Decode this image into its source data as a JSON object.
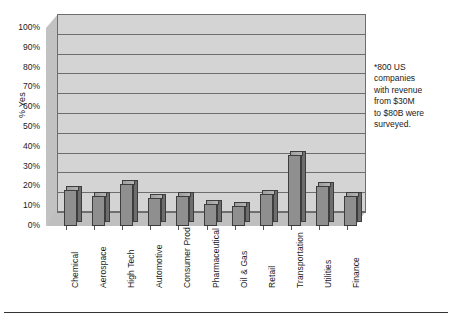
{
  "chart_data": {
    "type": "bar",
    "title": "",
    "subtitle": "",
    "xlabel": "",
    "ylabel": "% Yes",
    "ylim": [
      0,
      100
    ],
    "yunit": "%",
    "grid": true,
    "legend": false,
    "style": "3d-column",
    "categories": [
      "Chemical",
      "Aerospace",
      "High Tech",
      "Automotive",
      "Consumer Prod",
      "Pharmaceutical",
      "Oil & Gas",
      "Retail",
      "Transportation",
      "Utilities",
      "Finance"
    ],
    "values": [
      18,
      15,
      21,
      14,
      15,
      11,
      10,
      16,
      36,
      20,
      15
    ],
    "ytick_labels": [
      "100%",
      "90%",
      "80%",
      "70%",
      "60%",
      "50%",
      "40%",
      "30%",
      "20%",
      "10%",
      "0%"
    ],
    "ytick_values": [
      100,
      90,
      80,
      70,
      60,
      50,
      40,
      30,
      20,
      10,
      0
    ],
    "annotations": [
      {
        "name": "survey-note",
        "text": "*800 US companies with revenue from $30M to $80B were surveyed.",
        "lines": [
          "*800 US",
          "companies",
          "with revenue",
          "from $30M",
          "to $80B were",
          "surveyed."
        ]
      }
    ],
    "colors": {
      "bar_front": "#8f8f8f",
      "bar_side": "#6d6d6d",
      "bar_top": "#a8a8a8",
      "plot_background": "#d4d4d4",
      "gridline": "#6e6e6e",
      "text": "#1a1a1a",
      "page_background": "#ffffff"
    }
  }
}
